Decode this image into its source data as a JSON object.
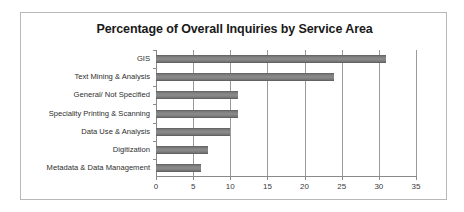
{
  "chart_data": {
    "type": "bar",
    "orientation": "horizontal",
    "title": "Percentage of Overall Inquiries by Service Area",
    "xlabel": "",
    "ylabel": "",
    "xlim": [
      0,
      35
    ],
    "xticks": [
      0,
      5,
      10,
      15,
      20,
      25,
      30,
      35
    ],
    "xtick_labels": [
      "0",
      "5",
      "10",
      "15",
      "20",
      "25",
      "30",
      "35"
    ],
    "grid": true,
    "grid_axis": "x",
    "legend": false,
    "bar_color": "#808080",
    "categories": [
      "GIS",
      "Text Mining & Analysis",
      "General/ Not Specified",
      "Speciality Printing & Scanning",
      "Data Use & Analysis",
      "Digitization",
      "Metadata & Data Management"
    ],
    "values": [
      31,
      24,
      11,
      11,
      10,
      7,
      6
    ]
  }
}
